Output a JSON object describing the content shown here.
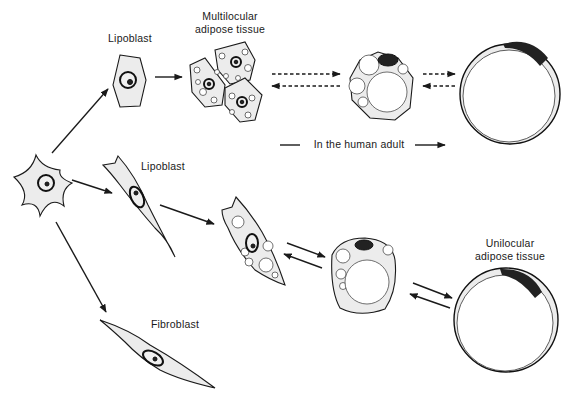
{
  "labels": {
    "lipoblast_top": "Lipoblast",
    "multilocular": [
      "Multilocular",
      "adipose tissue"
    ],
    "lipoblast_mid": "Lipoblast",
    "fibroblast": "Fibroblast",
    "unilocular": [
      "Unilocular",
      "adipose tissue"
    ],
    "human_adult": "In the human adult"
  },
  "diagram": {
    "type": "cell-differentiation",
    "nodes": [
      "Mesenchymal cell",
      "Lipoblast (polygonal)",
      "Multilocular adipose tissue",
      "Paucilocular adipocyte",
      "Unilocular adipocyte",
      "Lipoblast (spindle)",
      "Lipoblast with droplets",
      "Multivacuolar adipocyte",
      "Unilocular adipose tissue",
      "Fibroblast"
    ],
    "edges": [
      {
        "from": "Mesenchymal cell",
        "to": "Lipoblast (polygonal)",
        "style": "solid"
      },
      {
        "from": "Mesenchymal cell",
        "to": "Lipoblast (spindle)",
        "style": "solid"
      },
      {
        "from": "Mesenchymal cell",
        "to": "Fibroblast",
        "style": "solid"
      },
      {
        "from": "Lipoblast (polygonal)",
        "to": "Multilocular adipose tissue",
        "style": "solid"
      },
      {
        "from": "Multilocular adipose tissue",
        "to": "Paucilocular adipocyte",
        "style": "dashed",
        "bidirectional": true
      },
      {
        "from": "Paucilocular adipocyte",
        "to": "Unilocular adipocyte",
        "style": "dashed",
        "bidirectional": true
      },
      {
        "from": "Lipoblast (spindle)",
        "to": "Lipoblast with droplets",
        "style": "solid"
      },
      {
        "from": "Lipoblast with droplets",
        "to": "Multivacuolar adipocyte",
        "style": "solid",
        "bidirectional": true
      },
      {
        "from": "Multivacuolar adipocyte",
        "to": "Unilocular adipose tissue",
        "style": "solid",
        "bidirectional": true
      }
    ]
  }
}
